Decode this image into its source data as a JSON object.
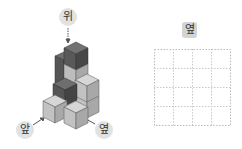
{
  "labels": {
    "top": "위",
    "front": "앞",
    "side": "옆",
    "answer_grid_label": "옆"
  },
  "answer_grid": {
    "rows": 4,
    "cols": 4
  },
  "colors": {
    "dark_top": "#6e6e6e",
    "dark_left": "#555555",
    "dark_right": "#444444",
    "light_top": "#d6d6d6",
    "light_left": "#bdbdbd",
    "light_right": "#a8a8a8",
    "grid_line": "#c8c8c8"
  }
}
